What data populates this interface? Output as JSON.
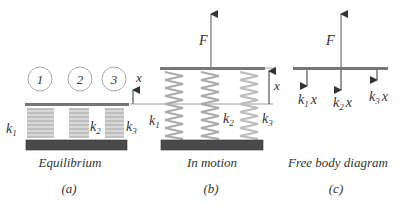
{
  "figure": {
    "panels": [
      {
        "id": "a",
        "caption": "Equilibrium",
        "label": "(a)",
        "masses": [
          "1",
          "2",
          "3"
        ],
        "springs": [
          "k",
          "k",
          "k"
        ],
        "spring_subs": [
          "1",
          "2",
          "3"
        ],
        "displacement_label": "x"
      },
      {
        "id": "b",
        "caption": "In motion",
        "label": "(b)",
        "force_label": "F",
        "springs": [
          "k",
          "k",
          "k"
        ],
        "spring_subs": [
          "1",
          "2",
          "3"
        ],
        "displacement_label": "x"
      },
      {
        "id": "c",
        "caption": "Free body diagram",
        "label": "(c)",
        "force_label": "F",
        "spring_forces": [
          {
            "k": "k",
            "sub": "1",
            "var": "x"
          },
          {
            "k": "k",
            "sub": "2",
            "var": "x"
          },
          {
            "k": "k",
            "sub": "3",
            "var": "x"
          }
        ]
      }
    ],
    "colors": {
      "spring": "#aaaaaa",
      "plate": "#666666",
      "ground": "#4a4a4a",
      "line": "#555555",
      "text": "#333333"
    }
  }
}
